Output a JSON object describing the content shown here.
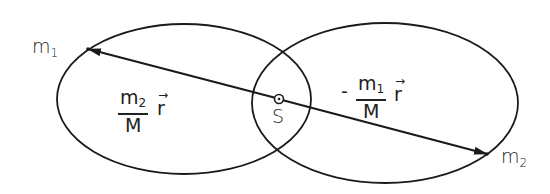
{
  "diagram": {
    "type": "two-body orbits about common center of mass",
    "stroke_color": "#1a1a1a",
    "background": "#ffffff",
    "nodes": {
      "m1": {
        "label": "m",
        "subscript": "1",
        "x": 88,
        "y": 49
      },
      "m2": {
        "label": "m",
        "subscript": "2",
        "x": 487,
        "y": 154
      },
      "center_of_mass": {
        "label": "S",
        "x": 279,
        "y": 99
      }
    },
    "orbits": [
      {
        "name": "orbit-m1",
        "cx": 184,
        "cy": 99,
        "rx": 127,
        "ry": 75
      },
      {
        "name": "orbit-m2",
        "cx": 385,
        "cy": 103,
        "rx": 133,
        "ry": 80
      }
    ],
    "vectors": [
      {
        "from": "S",
        "to": "m1",
        "label_num": "m",
        "label_num_sub": "2",
        "label_den": "M",
        "label_vec": "r",
        "sign": ""
      },
      {
        "from": "S",
        "to": "m2",
        "label_num": "m",
        "label_num_sub": "1",
        "label_den": "M",
        "label_vec": "r",
        "sign": "-"
      }
    ]
  }
}
